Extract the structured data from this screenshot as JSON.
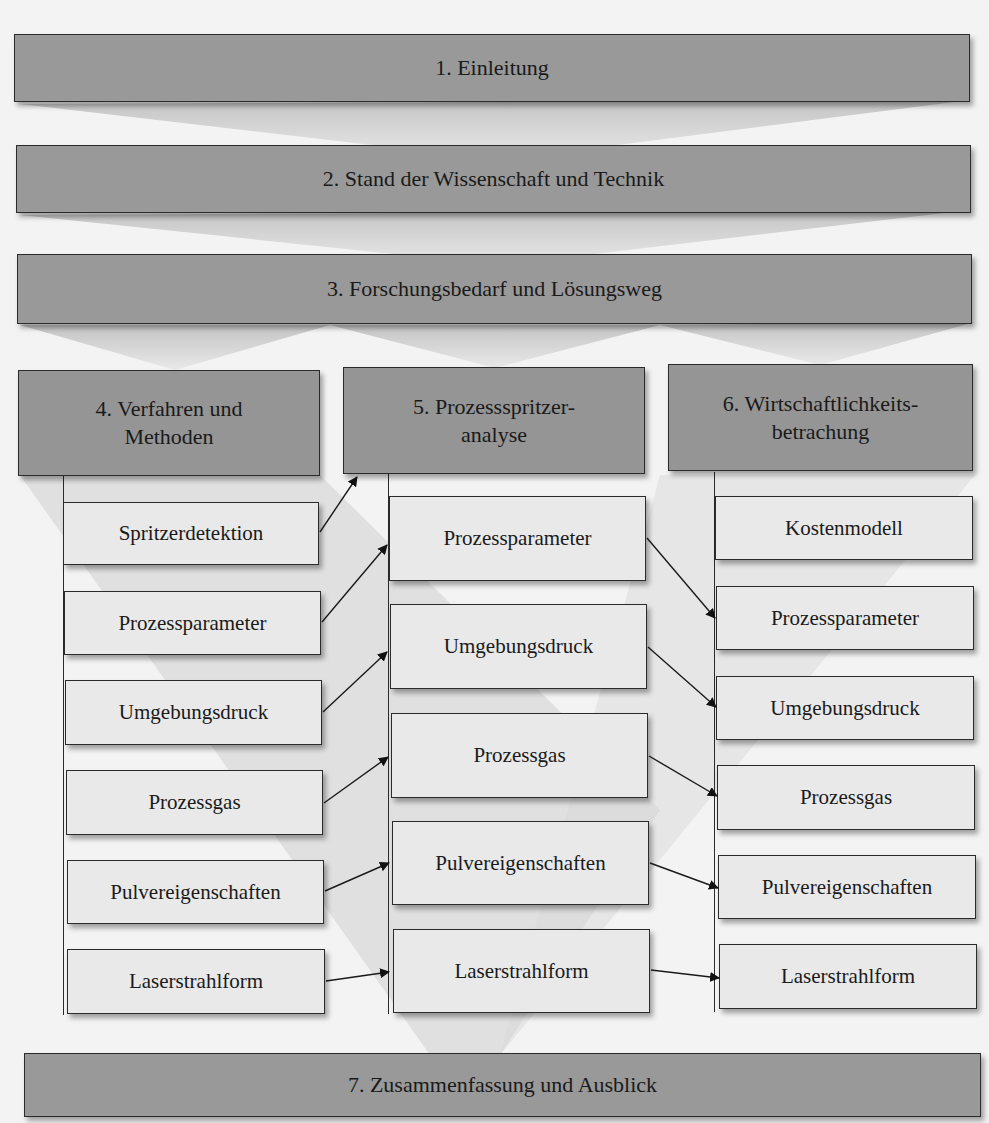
{
  "diagram": {
    "sections": [
      {
        "id": "1",
        "label": "1. Einleitung"
      },
      {
        "id": "2",
        "label": "2. Stand der Wissenschaft und Technik"
      },
      {
        "id": "3",
        "label": "3. Forschungsbedarf und Lösungsweg"
      },
      {
        "id": "7",
        "label": "7. Zusammenfassung und Ausblick"
      }
    ],
    "columns": [
      {
        "header": "4. Verfahren und\nMethoden",
        "items": [
          "Spritzerdetektion",
          "Prozessparameter",
          "Umgebungsdruck",
          "Prozessgas",
          "Pulvereigenschaften",
          "Laserstrahlform"
        ]
      },
      {
        "header": "5. Prozessspritzer-\nanalyse",
        "items": [
          "Prozessparameter",
          "Umgebungsdruck",
          "Prozessgas",
          "Pulvereigenschaften",
          "Laserstrahlform"
        ]
      },
      {
        "header": "6. Wirtschaftlichkeits-\nbetrachung",
        "items": [
          "Kostenmodell",
          "Prozessparameter",
          "Umgebungsdruck",
          "Prozessgas",
          "Pulvereigenschaften",
          "Laserstrahlform"
        ]
      }
    ],
    "connections": [
      {
        "from": "4: Spritzerdetektion",
        "to": "5: header"
      },
      {
        "from": "4: Prozessparameter",
        "to": "5: Prozessparameter"
      },
      {
        "from": "4: Umgebungsdruck",
        "to": "5: Umgebungsdruck"
      },
      {
        "from": "4: Prozessgas",
        "to": "5: Prozessgas"
      },
      {
        "from": "4: Pulvereigenschaften",
        "to": "5: Pulvereigenschaften"
      },
      {
        "from": "4: Laserstrahlform",
        "to": "5: Laserstrahlform"
      },
      {
        "from": "5: Prozessparameter",
        "to": "6: Prozessparameter"
      },
      {
        "from": "5: Umgebungsdruck",
        "to": "6: Umgebungsdruck"
      },
      {
        "from": "5: Prozessgas",
        "to": "6: Prozessgas"
      },
      {
        "from": "5: Pulvereigenschaften",
        "to": "6: Pulvereigenschaften"
      },
      {
        "from": "5: Laserstrahlform",
        "to": "6: Laserstrahlform"
      }
    ],
    "colors": {
      "band": "#999999",
      "header": "#959595",
      "item": "#e9e9e9",
      "border": "#2b2b2b",
      "background": "#f3f3f3",
      "chevron": "#c8c8c8"
    }
  }
}
